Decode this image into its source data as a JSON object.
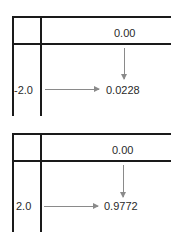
{
  "panels": [
    {
      "column_header": "0.00",
      "row_header": "-2.0",
      "result": "0.0228"
    },
    {
      "column_header": "0.00",
      "row_header": "2.0",
      "result": "0.9772"
    }
  ],
  "colors": {
    "grid_line": "#1a1a1a",
    "arrow": "#8a8a8a",
    "text": "#2a2a2a"
  }
}
